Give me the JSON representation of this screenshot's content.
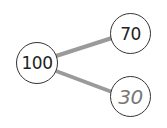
{
  "diagram": {
    "type": "number-bond",
    "whole": {
      "label": "100"
    },
    "parts": [
      {
        "label": "70",
        "style": "given"
      },
      {
        "label": "30",
        "style": "answer"
      }
    ],
    "colors": {
      "line": "#9a9a9a",
      "circle_border": "#333333",
      "answer_text": "#777777"
    }
  }
}
